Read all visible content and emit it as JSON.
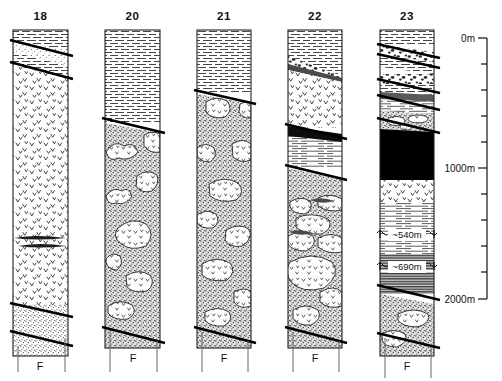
{
  "figure": {
    "background_color": "#ffffff",
    "line_color": "#111111"
  },
  "columns": [
    {
      "id": "col-18",
      "label": "18",
      "x": 13,
      "width": 55,
      "top": 30,
      "bottom": 356,
      "fault_label": "F",
      "units": [
        {
          "name": "mudstone-upper",
          "pattern": "mudstone",
          "y": 30,
          "h": 11
        },
        {
          "name": "fault-wedge-sandstone",
          "pattern": "sandstone-fine",
          "y": 41,
          "h": 21
        },
        {
          "name": "mudstone-lower",
          "pattern": "mudstone",
          "y": 62,
          "h": 18
        },
        {
          "name": "volcaniclastic-main",
          "pattern": "v-clasts",
          "y": 80,
          "h": 225
        },
        {
          "name": "sandstone-basal",
          "pattern": "sandstone-coarse",
          "y": 305,
          "h": 40
        }
      ],
      "faults": [
        {
          "name": "fault-upper",
          "y1": 40,
          "y2": 56
        },
        {
          "name": "fault-mid",
          "y1": 62,
          "y2": 79
        },
        {
          "name": "fault-base-upper",
          "y1": 303,
          "y2": 317
        },
        {
          "name": "fault-base-lower",
          "y1": 331,
          "y2": 346
        }
      ],
      "lenses": [
        {
          "name": "dark-lens-a",
          "y": 238
        },
        {
          "name": "dark-lens-b",
          "y": 245
        }
      ]
    },
    {
      "id": "col-20",
      "label": "20",
      "x": 105,
      "width": 55,
      "top": 30,
      "bottom": 348,
      "fault_label": "F",
      "units": [
        {
          "name": "mudstone-upper",
          "pattern": "mudstone",
          "y": 30,
          "h": 92
        },
        {
          "name": "sandstone-with-clasts",
          "pattern": "sandstone-clasts",
          "y": 122,
          "h": 206
        }
      ],
      "faults": [
        {
          "name": "fault-upper",
          "y1": 118,
          "y2": 133
        },
        {
          "name": "fault-base",
          "y1": 327,
          "y2": 343
        }
      ],
      "lenses": []
    },
    {
      "id": "col-21",
      "label": "21",
      "x": 197,
      "width": 54,
      "top": 30,
      "bottom": 348,
      "fault_label": "F",
      "units": [
        {
          "name": "mudstone-upper",
          "pattern": "mudstone",
          "y": 30,
          "h": 63
        },
        {
          "name": "sandstone-with-clasts",
          "pattern": "sandstone-clasts",
          "y": 93,
          "h": 237
        }
      ],
      "faults": [
        {
          "name": "fault-upper",
          "y1": 90,
          "y2": 104
        },
        {
          "name": "fault-base",
          "y1": 327,
          "y2": 343
        }
      ],
      "lenses": []
    },
    {
      "id": "col-22",
      "label": "22",
      "x": 288,
      "width": 54,
      "top": 30,
      "bottom": 348,
      "fault_label": "F",
      "units": [
        {
          "name": "mudstone-upper",
          "pattern": "mudstone",
          "y": 30,
          "h": 25
        },
        {
          "name": "conglomerate-wedge",
          "pattern": "conglomerate",
          "y": 55,
          "h": 28
        },
        {
          "name": "volcaniclastic-main",
          "pattern": "v-clasts",
          "y": 83,
          "h": 45
        },
        {
          "name": "siltstone-laminated",
          "pattern": "siltstone",
          "y": 128,
          "h": 40
        },
        {
          "name": "sandstone-with-clasts",
          "pattern": "sandstone-clasts",
          "y": 168,
          "h": 162
        }
      ],
      "faults": [
        {
          "name": "fault-mid-upper",
          "y1": 124,
          "y2": 139
        },
        {
          "name": "fault-mid-lower",
          "y1": 165,
          "y2": 180
        },
        {
          "name": "fault-base",
          "y1": 327,
          "y2": 343
        }
      ],
      "lenses": [
        {
          "name": "black-wedge",
          "y": 128
        }
      ]
    },
    {
      "id": "col-23",
      "label": "23",
      "x": 380,
      "width": 54,
      "top": 30,
      "bottom": 356,
      "fault_label": "F",
      "units": [
        {
          "name": "mudstone-top",
          "pattern": "mudstone",
          "y": 30,
          "h": 14
        },
        {
          "name": "conglomerate-a",
          "pattern": "conglomerate",
          "y": 44,
          "h": 11
        },
        {
          "name": "mudstone-b",
          "pattern": "mudstone",
          "y": 55,
          "h": 15
        },
        {
          "name": "conglomerate-b",
          "pattern": "conglomerate",
          "y": 70,
          "h": 10
        },
        {
          "name": "mudstone-c",
          "pattern": "mudstone",
          "y": 80,
          "h": 18
        },
        {
          "name": "siltstone-lenses",
          "pattern": "siltstone-lens",
          "y": 98,
          "h": 15
        },
        {
          "name": "sandstone-clasts-a",
          "pattern": "sandstone-clasts",
          "y": 113,
          "h": 15
        },
        {
          "name": "coal-black",
          "pattern": "black",
          "y": 128,
          "h": 50
        },
        {
          "name": "volcaniclastic",
          "pattern": "v-clasts",
          "y": 178,
          "h": 22
        },
        {
          "name": "siltstone-540",
          "pattern": "siltstone",
          "y": 200,
          "h": 32
        },
        {
          "name": "shale-dark-690",
          "pattern": "shale-dark",
          "y": 240,
          "h": 30
        },
        {
          "name": "shale-dark-lower",
          "pattern": "shale-dark",
          "y": 270,
          "h": 22
        },
        {
          "name": "sandstone-basal",
          "pattern": "sandstone-clasts",
          "y": 292,
          "h": 55
        }
      ],
      "faults": [
        {
          "name": "fault-1",
          "y1": 44,
          "y2": 58
        },
        {
          "name": "fault-2",
          "y1": 54,
          "y2": 68
        },
        {
          "name": "fault-3",
          "y1": 79,
          "y2": 93
        },
        {
          "name": "fault-4",
          "y1": 95,
          "y2": 110
        },
        {
          "name": "fault-5",
          "y1": 118,
          "y2": 133
        },
        {
          "name": "fault-base-upper",
          "y1": 285,
          "y2": 300
        },
        {
          "name": "fault-base-lower",
          "y1": 333,
          "y2": 348
        }
      ],
      "thickness_marks": [
        {
          "name": "thickness-540",
          "label": "~540m",
          "y": 236
        },
        {
          "name": "thickness-690",
          "label": "~690m",
          "y": 268
        }
      ]
    }
  ],
  "scale": {
    "name": "depth-scale",
    "x": 470,
    "top_y": 38,
    "bottom_y": 299,
    "labels": [
      {
        "text": "0m",
        "y": 38
      },
      {
        "text": "1000m",
        "y": 168
      },
      {
        "text": "2000m",
        "y": 299
      }
    ],
    "ticks": [
      38,
      64,
      90,
      116,
      142,
      168,
      194,
      220,
      246,
      272,
      299
    ],
    "major_ticks": [
      38,
      168,
      299
    ],
    "unit": "m",
    "range_min": 0,
    "range_max": 2000,
    "tick_interval": 200
  }
}
